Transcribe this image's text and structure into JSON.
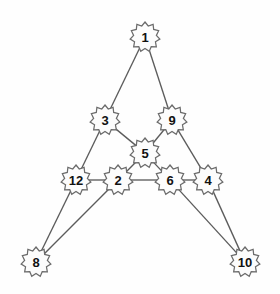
{
  "diagram": {
    "type": "node-link-graph",
    "canvas": {
      "width": 280,
      "height": 294,
      "background": "#fefefe"
    },
    "style": {
      "node_shape": "starburst-badge",
      "node_fill": "#fcfcfc",
      "node_stroke": "#6b6b6b",
      "node_radius": 15,
      "node_inner_radius": 11.5,
      "node_points": 11,
      "edge_stroke": "#5c5c5c",
      "edge_width": 1.35,
      "label_color": "#111111",
      "label_font_size": 13
    },
    "nodes": [
      {
        "id": "n1",
        "label": "1",
        "x": 145,
        "y": 37,
        "icon": "starburst-node-icon"
      },
      {
        "id": "n3",
        "label": "3",
        "x": 105,
        "y": 120,
        "icon": "starburst-node-icon"
      },
      {
        "id": "n9",
        "label": "9",
        "x": 172,
        "y": 120,
        "icon": "starburst-node-icon"
      },
      {
        "id": "n5",
        "label": "5",
        "x": 145,
        "y": 153,
        "icon": "starburst-node-icon"
      },
      {
        "id": "n12",
        "label": "12",
        "x": 76,
        "y": 180,
        "icon": "starburst-node-icon"
      },
      {
        "id": "n2",
        "label": "2",
        "x": 118,
        "y": 180,
        "icon": "starburst-node-icon"
      },
      {
        "id": "n6",
        "label": "6",
        "x": 170,
        "y": 180,
        "icon": "starburst-node-icon"
      },
      {
        "id": "n4",
        "label": "4",
        "x": 208,
        "y": 180,
        "icon": "starburst-node-icon"
      },
      {
        "id": "n8",
        "label": "8",
        "x": 36,
        "y": 262,
        "icon": "starburst-node-icon"
      },
      {
        "id": "n10",
        "label": "10",
        "x": 245,
        "y": 262,
        "icon": "starburst-node-icon"
      }
    ],
    "edges": [
      {
        "from": "n1",
        "to": "n3"
      },
      {
        "from": "n1",
        "to": "n9"
      },
      {
        "from": "n3",
        "to": "n12"
      },
      {
        "from": "n3",
        "to": "n5"
      },
      {
        "from": "n9",
        "to": "n4"
      },
      {
        "from": "n9",
        "to": "n5"
      },
      {
        "from": "n5",
        "to": "n2"
      },
      {
        "from": "n5",
        "to": "n6"
      },
      {
        "from": "n12",
        "to": "n2"
      },
      {
        "from": "n2",
        "to": "n6"
      },
      {
        "from": "n6",
        "to": "n4"
      },
      {
        "from": "n12",
        "to": "n8"
      },
      {
        "from": "n2",
        "to": "n8"
      },
      {
        "from": "n6",
        "to": "n10"
      },
      {
        "from": "n4",
        "to": "n10"
      }
    ]
  }
}
